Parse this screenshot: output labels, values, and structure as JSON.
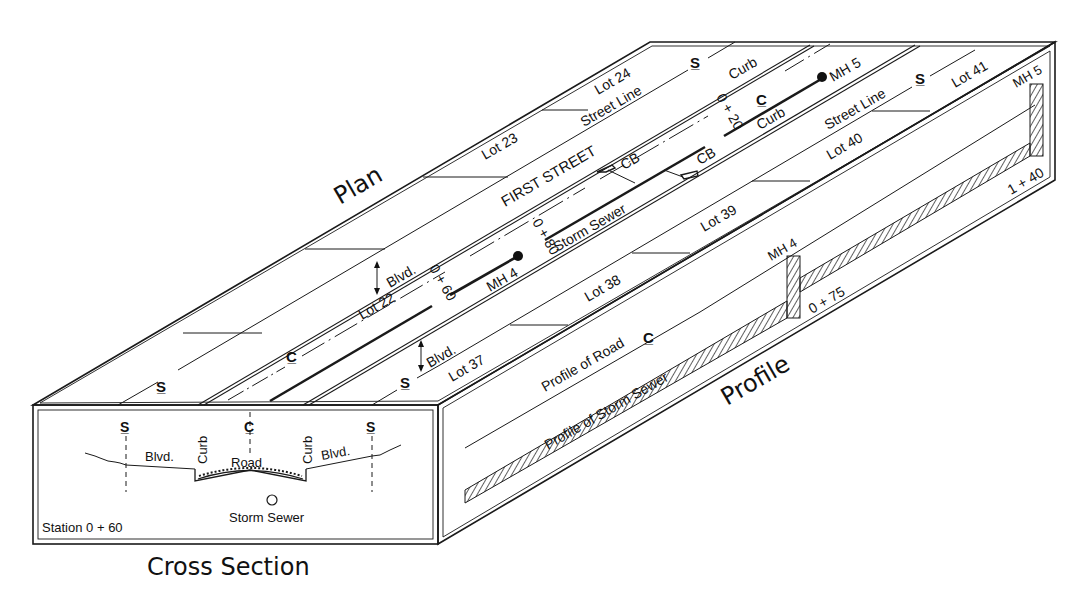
{
  "titles": {
    "plan": "Plan",
    "profile": "Profile",
    "cross_section": "Cross Section"
  },
  "plan": {
    "street_name": "FIRST STREET",
    "lots_north": [
      "Lot 22",
      "Lot 23",
      "Lot 24"
    ],
    "lots_south": [
      "Lot 37",
      "Lot 38",
      "Lot 39",
      "Lot 40",
      "Lot 41"
    ],
    "street_line_labels": [
      "Street Line",
      "Street Line"
    ],
    "curb_labels": [
      "Curb",
      "Curb"
    ],
    "boulevard_labels": [
      "Blvd.",
      "Blvd."
    ],
    "catch_basin_labels": [
      "CB",
      "CB"
    ],
    "storm_sewer_label": "Storm Sewer",
    "manholes": [
      "MH 4",
      "MH 5"
    ],
    "stations": [
      "0 + 60",
      "0 + 80",
      "0 + 20"
    ],
    "symbols": {
      "street_line": "S/L",
      "centerline": "C/L"
    }
  },
  "profile": {
    "road_label": "Profile of Road",
    "sewer_label": "Profile of Storm Sewer",
    "manholes": [
      "MH 4",
      "MH 5"
    ],
    "stations": [
      "0 + 75",
      "1 + 40"
    ]
  },
  "cross_section": {
    "station": "Station 0 + 60",
    "labels": {
      "blvd_left": "Blvd.",
      "blvd_right": "Blvd.",
      "curb_left": "Curb",
      "curb_right": "Curb",
      "road": "Road",
      "storm_sewer": "Storm Sewer"
    }
  },
  "colors": {
    "ink": "#1a1a1a",
    "paper": "#ffffff"
  }
}
